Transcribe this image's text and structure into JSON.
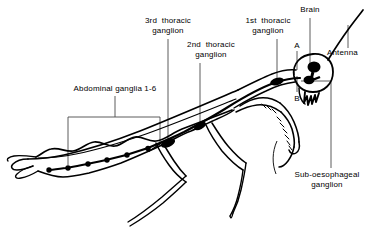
{
  "figure": {
    "background_color": "#ffffff",
    "ink_color": "#000000",
    "leader_color": "#555555"
  },
  "labels": {
    "abdominal_ganglia": "Abdominal ganglia 1-6",
    "third_thoracic": "3rd  thoracic\nganglion",
    "second_thoracic": "2nd  thoracic\nganglion",
    "first_thoracic": "1st  thoracic\nganglion",
    "brain": "Brain",
    "antenna": "Antenna",
    "marker_a": "A",
    "marker_b": "B",
    "sub_oesophageal": "Sub-oesophageal\nganglion"
  },
  "anatomy": {
    "ganglia_counts": {
      "abdominal": 6,
      "thoracic": 3
    },
    "parts": [
      "brain",
      "sub-oesophageal ganglion",
      "1st thoracic ganglion",
      "2nd thoracic ganglion",
      "3rd thoracic ganglion",
      "abdominal ganglia 1-6",
      "antenna",
      "ventral nerve cord",
      "raptorial foreleg",
      "middle leg",
      "hind leg",
      "wing",
      "abdomen",
      "cerci",
      "mouthparts"
    ]
  }
}
